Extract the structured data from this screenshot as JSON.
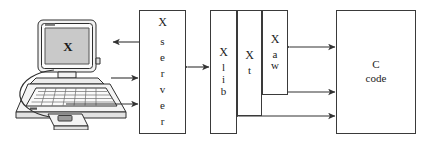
{
  "diagram": {
    "width": 425,
    "height": 144,
    "colors": {
      "background": "#ffffff",
      "stroke": "#3a3a3a",
      "arrow": "#333333",
      "text": "#1c1c1c",
      "screen_fill": "#c9c9c9"
    }
  },
  "boxes": {
    "x_server": {
      "name": "X server",
      "lead": "X",
      "letters": [
        "s",
        "e",
        "r",
        "v",
        "e",
        "r"
      ]
    },
    "xlib": {
      "name": "Xlib",
      "lead": "X",
      "letters": [
        "l",
        "i",
        "b"
      ]
    },
    "xt": {
      "name": "Xt",
      "lead": "X",
      "letters": [
        "t"
      ]
    },
    "xaw": {
      "name": "Xaw",
      "lead": "X",
      "letters": [
        "a",
        "w"
      ]
    },
    "c_code": {
      "name": "C code",
      "line1": "C",
      "line2": "code"
    }
  },
  "terminal": {
    "monitor_label": "X",
    "icon_names": [
      "monitor-icon",
      "keyboard-icon",
      "mouse-icon",
      "cable-icon"
    ]
  },
  "arrows": [
    {
      "name": "xserver-to-display",
      "direction": "left",
      "from": "X server",
      "to": "monitor"
    },
    {
      "name": "keyboard-to-xserver",
      "direction": "right",
      "from": "keyboard",
      "to": "X server"
    },
    {
      "name": "mouse-to-xserver",
      "direction": "right",
      "from": "mouse",
      "to": "X server"
    },
    {
      "name": "xserver-to-xlib",
      "direction": "both",
      "from": "X server",
      "to": "Xlib"
    },
    {
      "name": "xaw-to-ccode",
      "direction": "both",
      "from": "Xaw",
      "to": "C code"
    },
    {
      "name": "xt-to-ccode",
      "direction": "both",
      "from": "Xt",
      "to": "C code"
    },
    {
      "name": "xlib-to-ccode",
      "direction": "both",
      "from": "Xlib",
      "to": "C code"
    }
  ]
}
